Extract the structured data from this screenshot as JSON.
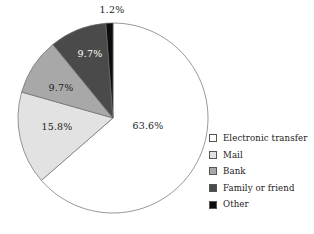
{
  "chart_data": {
    "type": "pie",
    "title": "",
    "subtitle": "",
    "xlabel": "",
    "ylabel": "",
    "legend_position": "right",
    "grid": false,
    "start_angle_deg": 0,
    "direction": "clockwise",
    "categories": [
      "Electronic transfer",
      "Mail",
      "Bank",
      "Family or friend",
      "Other"
    ],
    "values": [
      63.6,
      15.8,
      9.7,
      9.7,
      1.2
    ],
    "value_unit": "%",
    "slices": [
      {
        "label": "Electronic transfer",
        "value": 63.6,
        "data_label": "63.6%",
        "color": "#ffffff",
        "label_color": "#1a1a1a",
        "label_x": 148,
        "label_y": 126
      },
      {
        "label": "Mail",
        "value": 15.8,
        "data_label": "15.8%",
        "color": "#e2e2e2",
        "label_color": "#1a1a1a",
        "label_y": 127,
        "label_x": 57
      },
      {
        "label": "Bank",
        "value": 9.7,
        "data_label": "9.7%",
        "color": "#a8a8a8",
        "label_color": "#1a1a1a",
        "label_x": 61,
        "label_y": 88
      },
      {
        "label": "Family or friend",
        "value": 9.7,
        "data_label": "9.7%",
        "color": "#4a4a4a",
        "label_color": "#ffffff",
        "label_x": 90,
        "label_y": 54
      },
      {
        "label": "Other",
        "value": 1.2,
        "data_label": "1.2%",
        "color": "#0d0d0d",
        "label_color": "#1a1a1a",
        "label_x": 112,
        "label_y": 10
      }
    ],
    "geometry": {
      "center_x": 113,
      "center_y": 118,
      "radius": 95,
      "outline_color": "#6b6b6b"
    }
  },
  "legend": {
    "items": [
      {
        "label": "Electronic transfer",
        "color": "#ffffff"
      },
      {
        "label": "Mail",
        "color": "#e2e2e2"
      },
      {
        "label": "Bank",
        "color": "#a8a8a8"
      },
      {
        "label": "Family or friend",
        "color": "#4a4a4a"
      },
      {
        "label": "Other",
        "color": "#0d0d0d"
      }
    ]
  }
}
